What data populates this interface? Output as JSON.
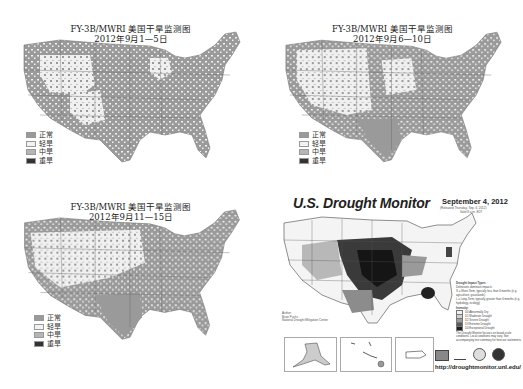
{
  "panels": [
    {
      "id": "fy3b-sep1-5",
      "title_line1": "FY-3B/MWRI 美国干旱监测图",
      "title_line2": "2012年9月1—5日",
      "legend": [
        {
          "label": "正常",
          "color": "#9a9a9a"
        },
        {
          "label": "轻旱",
          "color": "#f2f2f2"
        },
        {
          "label": "中旱",
          "color": "#b5b5b5"
        },
        {
          "label": "重旱",
          "color": "#333333"
        }
      ]
    },
    {
      "id": "fy3b-sep6-10",
      "title_line1": "FY-3B/MWRI 美国干旱监测图",
      "title_line2": "2012年9月6—10日",
      "legend": [
        {
          "label": "正常",
          "color": "#9a9a9a"
        },
        {
          "label": "轻旱",
          "color": "#f2f2f2"
        },
        {
          "label": "中旱",
          "color": "#b5b5b5"
        },
        {
          "label": "重旱",
          "color": "#333333"
        }
      ]
    },
    {
      "id": "fy3b-sep11-15",
      "title_line1": "FY-3B/MWRI 美国干旱监测图",
      "title_line2": "2012年9月11—15日",
      "legend": [
        {
          "label": "正常",
          "color": "#9a9a9a"
        },
        {
          "label": "轻旱",
          "color": "#f2f2f2"
        },
        {
          "label": "中旱",
          "color": "#b5b5b5"
        },
        {
          "label": "重旱",
          "color": "#333333"
        }
      ]
    }
  ],
  "drought_monitor": {
    "title": "U.S. Drought Monitor",
    "date": "September 4, 2012",
    "released": "(Released Thursday, Sep. 6, 2012)",
    "valid": "Valid 8 a.m. EDT",
    "author_label": "Author:",
    "author_name": "Brian Fuchs",
    "author_org": "National Drought Mitigation Center",
    "impact_types_title": "Drought Impact Types:",
    "impact_types": [
      "Delineates dominant impacts",
      "S = Short-Term, typically less than 6 months (e.g. agriculture, grasslands)",
      "L = Long-Term, typically greater than 6 months (e.g. hydrology, ecology)"
    ],
    "intensity_title": "Intensity:",
    "intensity": [
      {
        "label": "D0 Abnormally Dry",
        "color": "#f0f0f0"
      },
      {
        "label": "D1 Moderate Drought",
        "color": "#cfcfcf"
      },
      {
        "label": "D2 Severe Drought",
        "color": "#9c9c9c"
      },
      {
        "label": "D3 Extreme Drought",
        "color": "#5a5a5a"
      },
      {
        "label": "D4 Exceptional Drought",
        "color": "#1e1e1e"
      }
    ],
    "note": "The Drought Monitor focuses on broad-scale conditions. Local conditions may vary. See accompanying text summary for forecast statements.",
    "url": "http://droughtmonitor.unl.edu/"
  }
}
